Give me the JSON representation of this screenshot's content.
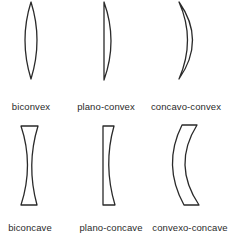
{
  "figure": {
    "stroke_color": "#2a2a2a",
    "background_color": "#ffffff",
    "rows": [
      {
        "name": "converging",
        "lenses": [
          {
            "label": "biconvex",
            "shape": "biconvex"
          },
          {
            "label": "plano-convex",
            "shape": "plano-convex"
          },
          {
            "label": "concavo-convex",
            "shape": "concavo-convex"
          }
        ]
      },
      {
        "name": "diverging",
        "lenses": [
          {
            "label": "biconcave",
            "shape": "biconcave"
          },
          {
            "label": "plano-concave",
            "shape": "plano-concave"
          },
          {
            "label": "convexo-concave",
            "shape": "convexo-concave"
          }
        ]
      }
    ]
  }
}
